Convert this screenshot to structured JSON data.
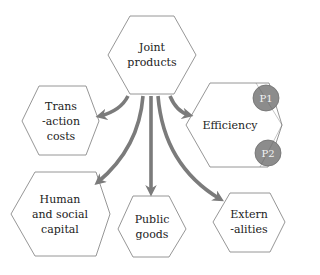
{
  "diagram": {
    "colors": {
      "background": "#ffffff",
      "hexagon_stroke": "#8a8a8a",
      "hexagon_fill": "#ffffff",
      "arrow": "#7b7b7b",
      "circle_fill": "#8c8c8c",
      "circle_stroke": "#6e6e6e",
      "text": "#222222"
    },
    "center_node": {
      "id": "joint-products",
      "line1": "Joint",
      "line2": "products"
    },
    "nodes": [
      {
        "id": "transaction-costs",
        "line1": "Trans",
        "line2": "-action",
        "line3": "costs"
      },
      {
        "id": "efficiency",
        "line1": "Efficiency",
        "markers": [
          "P1",
          "P2"
        ]
      },
      {
        "id": "human-social-capital",
        "line1": "Human",
        "line2": "and social",
        "line3": "capital"
      },
      {
        "id": "public-goods",
        "line1": "Public",
        "line2": "goods"
      },
      {
        "id": "externalities",
        "line1": "Extern",
        "line2": "-alities"
      }
    ],
    "edges": [
      {
        "from": "joint-products",
        "to": "transaction-costs"
      },
      {
        "from": "joint-products",
        "to": "efficiency"
      },
      {
        "from": "joint-products",
        "to": "human-social-capital"
      },
      {
        "from": "joint-products",
        "to": "public-goods"
      },
      {
        "from": "joint-products",
        "to": "externalities"
      }
    ],
    "markers": {
      "p1": "P1",
      "p2": "P2"
    }
  }
}
